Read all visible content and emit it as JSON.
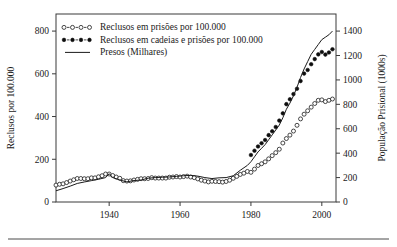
{
  "figure": {
    "background": "#ffffff",
    "frame_color": "#3a3a3a",
    "ink_color": "#1a1a1a"
  },
  "axes": {
    "left": {
      "title": "Reclusos por 100.000",
      "ticks": [
        "0",
        "200",
        "400",
        "600",
        "800"
      ],
      "min": 0,
      "max": 880
    },
    "right": {
      "title": "População Prisional  (1000s)",
      "ticks": [
        "0",
        "200",
        "400",
        "600",
        "800",
        "1000",
        "1200",
        "1400"
      ],
      "min": 0,
      "max": 1540
    },
    "bottom": {
      "title": "",
      "ticks": [
        "1940",
        "1960",
        "1980",
        "2000"
      ],
      "min": 1925,
      "max": 2004
    }
  },
  "legend": {
    "position": "top-left",
    "items": [
      {
        "label": "Reclusos em prisões por 100.000",
        "marker": "open-circle-dashed"
      },
      {
        "label": "Reclusos em cadeias e prisões por 100.000",
        "marker": "filled-circle-dashed"
      },
      {
        "label": "Presos (Milhares)",
        "marker": "solid-line"
      }
    ]
  },
  "chart_data": {
    "type": "line",
    "title": "",
    "xlabel": "",
    "ylabel": "Reclusos por 100.000",
    "y2label": "População Prisional  (1000s)",
    "xlim": [
      1925,
      2004
    ],
    "ylim": [
      0,
      880
    ],
    "y2lim": [
      0,
      1540
    ],
    "grid": false,
    "legend_position": "top-left",
    "series": [
      {
        "name": "Reclusos em prisões por 100.000",
        "marker": "open-circle",
        "axis": "left",
        "x": [
          1925,
          1926,
          1927,
          1928,
          1929,
          1930,
          1931,
          1932,
          1933,
          1934,
          1935,
          1936,
          1937,
          1938,
          1939,
          1940,
          1941,
          1942,
          1943,
          1944,
          1945,
          1946,
          1947,
          1948,
          1949,
          1950,
          1951,
          1952,
          1953,
          1954,
          1955,
          1956,
          1957,
          1958,
          1959,
          1960,
          1961,
          1962,
          1963,
          1964,
          1965,
          1966,
          1967,
          1968,
          1969,
          1970,
          1971,
          1972,
          1973,
          1974,
          1975,
          1976,
          1977,
          1978,
          1979,
          1980,
          1981,
          1982,
          1983,
          1984,
          1985,
          1986,
          1987,
          1988,
          1989,
          1990,
          1991,
          1992,
          1993,
          1994,
          1995,
          1996,
          1997,
          1998,
          1999,
          2000,
          2001,
          2002,
          2003
        ],
        "values": [
          79,
          83,
          85,
          91,
          98,
          104,
          110,
          110,
          109,
          109,
          113,
          113,
          118,
          123,
          131,
          131,
          124,
          117,
          111,
          100,
          98,
          99,
          103,
          106,
          109,
          109,
          110,
          114,
          112,
          112,
          112,
          112,
          116,
          117,
          119,
          117,
          119,
          121,
          117,
          114,
          108,
          102,
          98,
          94,
          97,
          96,
          95,
          93,
          96,
          102,
          111,
          120,
          129,
          135,
          143,
          139,
          154,
          171,
          179,
          188,
          202,
          217,
          231,
          247,
          276,
          297,
          313,
          332,
          359,
          389,
          411,
          427,
          444,
          461,
          476,
          478,
          470,
          476,
          482
        ]
      },
      {
        "name": "Reclusos em cadeias e prisões por 100.000",
        "marker": "filled-circle",
        "axis": "left",
        "x": [
          1980,
          1981,
          1982,
          1983,
          1984,
          1985,
          1986,
          1987,
          1988,
          1989,
          1990,
          1991,
          1992,
          1993,
          1994,
          1995,
          1996,
          1997,
          1998,
          1999,
          2000,
          2001,
          2002,
          2003
        ],
        "values": [
          220,
          240,
          260,
          275,
          290,
          313,
          331,
          351,
          381,
          415,
          458,
          481,
          505,
          530,
          566,
          601,
          618,
          645,
          669,
          691,
          702,
          690,
          700,
          715
        ]
      },
      {
        "name": "Presos (Milhares)",
        "marker": "line",
        "axis": "right",
        "x": [
          1925,
          1927,
          1929,
          1931,
          1933,
          1935,
          1937,
          1939,
          1940,
          1941,
          1943,
          1945,
          1947,
          1949,
          1951,
          1953,
          1955,
          1957,
          1959,
          1961,
          1963,
          1965,
          1967,
          1969,
          1971,
          1973,
          1975,
          1977,
          1979,
          1980,
          1981,
          1982,
          1983,
          1984,
          1985,
          1986,
          1987,
          1988,
          1989,
          1990,
          1991,
          1992,
          1993,
          1994,
          1995,
          1996,
          1997,
          1998,
          1999,
          2000,
          2001,
          2002,
          2003
        ],
        "values": [
          92,
          110,
          130,
          152,
          164,
          175,
          186,
          200,
          232,
          200,
          180,
          165,
          176,
          180,
          195,
          200,
          203,
          205,
          210,
          215,
          218,
          212,
          200,
          192,
          198,
          200,
          215,
          260,
          300,
          330,
          370,
          410,
          440,
          470,
          510,
          550,
          590,
          630,
          690,
          760,
          810,
          870,
          940,
          1020,
          1090,
          1150,
          1210,
          1250,
          1290,
          1330,
          1350,
          1370,
          1400
        ]
      }
    ]
  },
  "footer": {
    "rule": true
  }
}
